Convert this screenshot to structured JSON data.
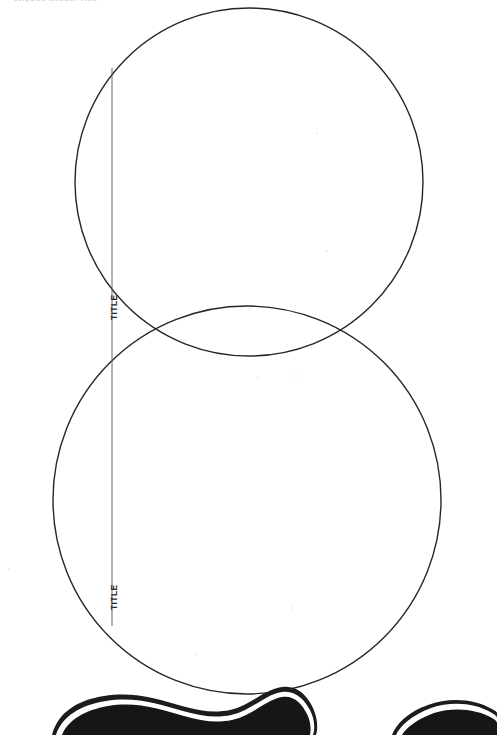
{
  "page": {
    "width": 497,
    "height": 735,
    "background_color": "#ffffff",
    "kind": "scanned-document-page"
  },
  "header": {
    "clipped_text": "clipped header line"
  },
  "diagram": {
    "name": "two-overlapping-circles",
    "stroke_color": "#262626",
    "stroke_width": 1.4,
    "fill": "none",
    "circles": [
      {
        "name": "upper-circle",
        "cx": 249,
        "cy": 182,
        "r": 174
      },
      {
        "name": "lower-circle",
        "cx": 247,
        "cy": 500,
        "r": 194
      }
    ],
    "chord_line": {
      "name": "vertical-chord-line",
      "x": 112,
      "y1": 68,
      "y2": 626,
      "stroke_color": "#555555",
      "stroke_width": 0.9
    },
    "intersections": [
      {
        "x": 112,
        "y": 347
      },
      {
        "x": 383,
        "y": 352
      }
    ],
    "labels": [
      {
        "name": "title-label-upper",
        "text": "TITLE",
        "rotation_deg": -90
      },
      {
        "name": "title-label-lower",
        "text": "TITLE",
        "rotation_deg": -90
      }
    ]
  },
  "bottom_graphics": {
    "name": "organic-blob-shapes",
    "fill_color": "#131313",
    "outline_color": "#1a1a1a",
    "gap_color": "#ffffff",
    "shapes": [
      {
        "name": "blob-left",
        "x_start": 60,
        "x_end": 285
      },
      {
        "name": "blob-right",
        "x_start": 395,
        "x_end": 497
      }
    ]
  },
  "artifacts": {
    "name": "scan-specks",
    "color": "#e8e8e8",
    "points": [
      {
        "x": 258,
        "y": 378,
        "r": 1.2
      },
      {
        "x": 296,
        "y": 376,
        "r": 1.1
      },
      {
        "x": 317,
        "y": 133,
        "r": 1.0
      },
      {
        "x": 327,
        "y": 251,
        "r": 0.9
      },
      {
        "x": 9,
        "y": 569,
        "r": 1.1
      },
      {
        "x": 196,
        "y": 654,
        "r": 0.9
      },
      {
        "x": 292,
        "y": 608,
        "r": 0.9
      }
    ]
  }
}
